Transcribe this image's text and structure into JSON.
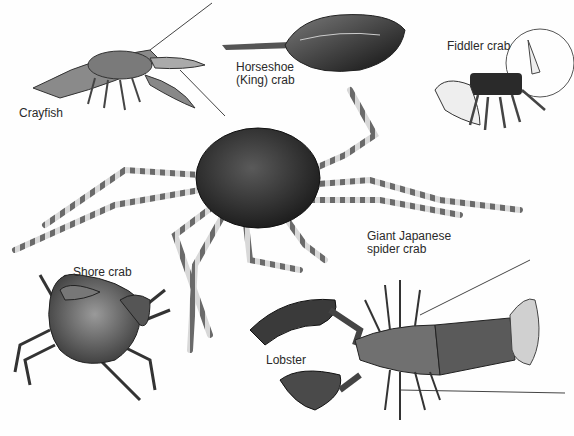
{
  "illustration": {
    "subject": "Crustaceans",
    "labels": {
      "crayfish": "Crayfish",
      "horseshoe_line1": "Horseshoe",
      "horseshoe_line2": "(King) crab",
      "fiddler": "Fiddler crab",
      "spider_line1": "Giant Japanese",
      "spider_line2": "spider crab",
      "shore": "Shore crab",
      "lobster": "Lobster"
    }
  },
  "colors": {
    "background": "#fefefe",
    "text": "#2a2a2a",
    "dark_shell": "#3a3a3a",
    "mid_shell": "#6b6b6b",
    "light_shell": "#bdbdbd"
  }
}
